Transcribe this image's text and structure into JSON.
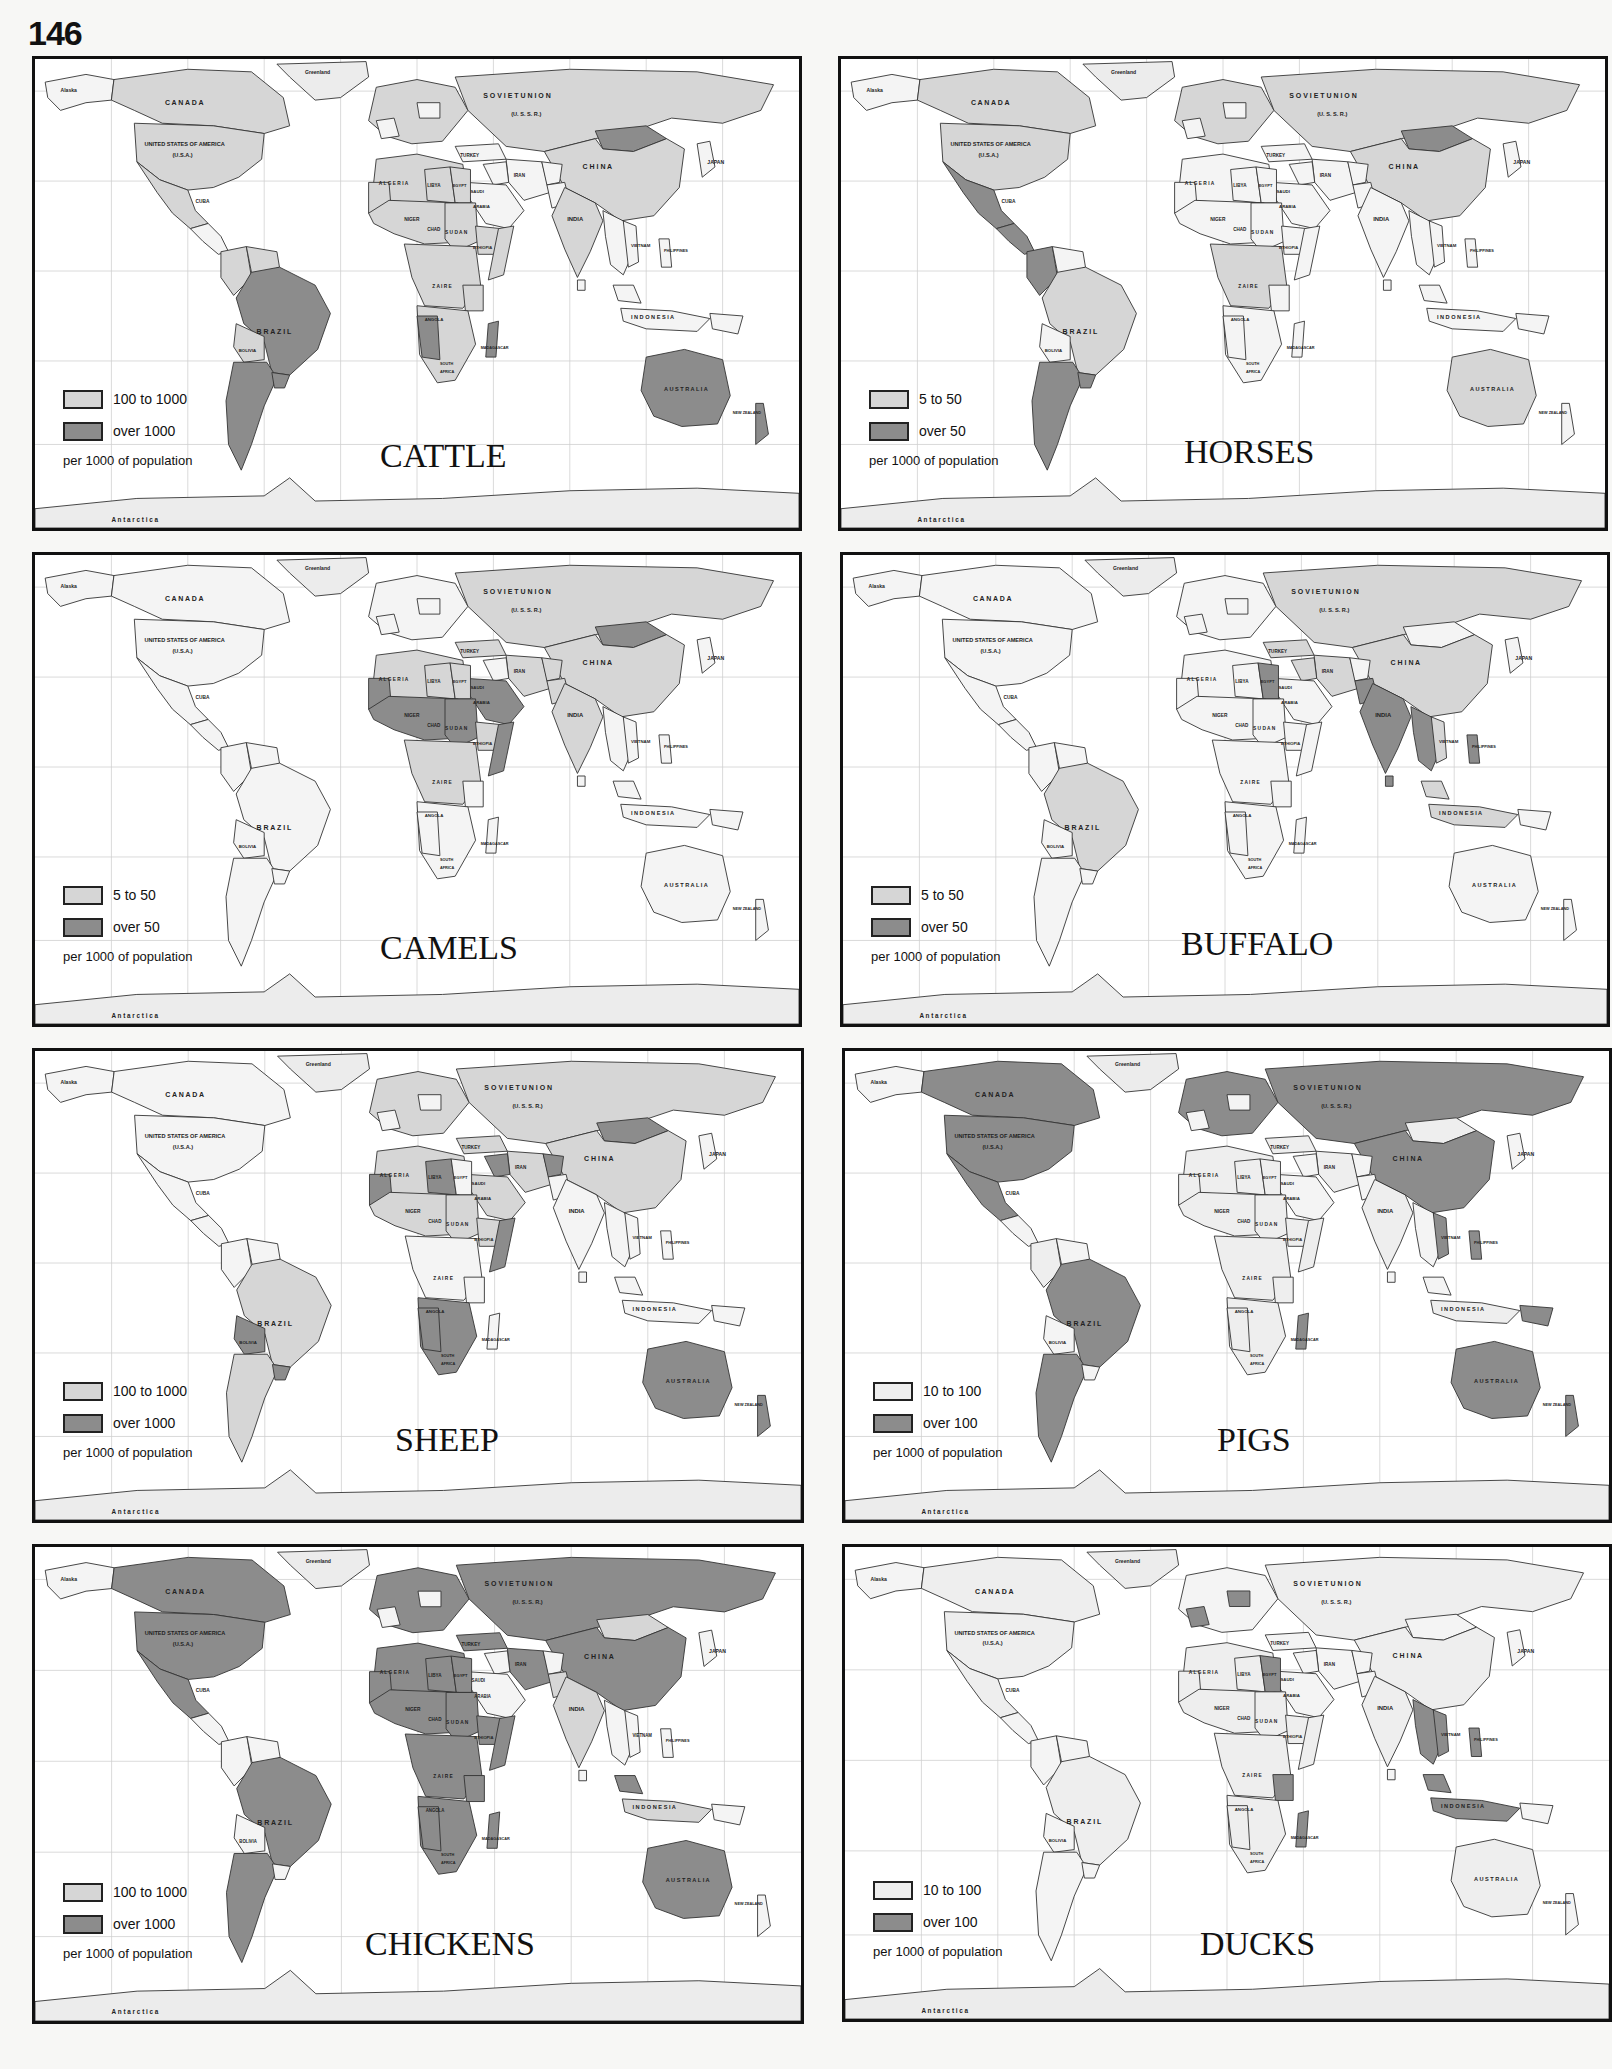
{
  "page_number": "146",
  "colors": {
    "light_shade": "#d6d6d6",
    "dark_shade": "#8c8c8c",
    "darker_shade": "#6f6f6f",
    "very_light_shade": "#eeeeee",
    "grid": "#c8c8c8",
    "border": "#111111"
  },
  "common": {
    "unit_note": "per 1000 of population",
    "map_labels": {
      "alaska": "Alaska",
      "greenland": "Greenland",
      "canada": "C A N A D A",
      "usa": "UNITED STATES OF AMERICA",
      "usa_abbr": "(U.S.A.)",
      "mexico": "MEXICO",
      "cuba": "CUBA",
      "venezuela": "VENEZUELA",
      "colombia": "COLOMBIA",
      "brazil": "B R A Z I L",
      "bolivia": "BOLIVIA",
      "uruguay": "URUGUAY",
      "soviet_union": "S O V I E T     U N I O N",
      "ussr": "(U. S. S. R.)",
      "mongolia": "PEOPLE'S REPUBLIC OF MONGOLIA",
      "china": "C H I N A",
      "japan": "JAPAN",
      "turkey": "TURKEY",
      "iran": "IRAN",
      "iraq": "IRAQ",
      "india": "INDIA",
      "pakistan": "PAKISTAN",
      "burma": "BURMA",
      "vietnam": "VIETNAM",
      "philippines": "PHILIPPINES",
      "malaysia": "MALAYSIA",
      "indonesia": "I N D O N E S I A",
      "papua": "PAPUA NEW GUINEA",
      "australia": "A U S T R A L I A",
      "new_zealand": "NEW ZEALAND",
      "algeria": "A L G E R I A",
      "libya": "LIBYA",
      "egypt": "EGYPT",
      "saudi": "SAUDI",
      "arabia": "ARABIA",
      "oman": "OMAN",
      "niger": "NIGER",
      "chad": "CHAD",
      "sudan": "S U D A N",
      "ethiopia": "ETHIOPIA",
      "nigeria": "NIGERIA",
      "zaire": "Z A I R E",
      "kenya": "KENYA",
      "angola": "ANGOLA",
      "zambia": "ZAMBIA",
      "madagascar": "MADAGASCAR",
      "south_africa_1": "SOUTH",
      "south_africa_2": "AFRICA",
      "sri_lanka": "SRI LANKA",
      "antarctica": "A    n    t    a    r    c    t    i    c    a"
    }
  },
  "maps": [
    {
      "id": "cattle",
      "title": "CATTLE",
      "legend": [
        {
          "label": "100 to 1000",
          "shade": "light"
        },
        {
          "label": "over 1000",
          "shade": "dark"
        }
      ],
      "dark_regions": [
        "Brazil",
        "Argentina",
        "Uruguay",
        "Australia",
        "Mongolia",
        "Namibia",
        "Botswana",
        "Madagascar",
        "New Zealand"
      ],
      "light_regions": [
        "Canada",
        "United States",
        "Mexico",
        "Soviet Union",
        "China",
        "India",
        "Africa (most)",
        "Europe",
        "Colombia",
        "Venezuela",
        "Bolivia"
      ]
    },
    {
      "id": "horses",
      "title": "HORSES",
      "legend": [
        {
          "label": "5 to 50",
          "shade": "light"
        },
        {
          "label": "over 50",
          "shade": "dark"
        }
      ],
      "dark_regions": [
        "Mexico",
        "Colombia",
        "Argentina",
        "Uruguay",
        "Mongolia",
        "Central America"
      ],
      "light_regions": [
        "Canada",
        "United States",
        "Brazil",
        "Soviet Union",
        "China",
        "Europe",
        "Australia",
        "Africa (parts)"
      ]
    },
    {
      "id": "camels",
      "title": "CAMELS",
      "legend": [
        {
          "label": "5 to 50",
          "shade": "light"
        },
        {
          "label": "over 50",
          "shade": "dark"
        }
      ],
      "dark_regions": [
        "Mauritania",
        "Mali",
        "Niger",
        "Chad",
        "Sudan",
        "Somalia",
        "Mongolia",
        "Western Sahara",
        "Oman"
      ],
      "light_regions": [
        "Soviet Union",
        "China",
        "India",
        "Pakistan",
        "Afghanistan",
        "Iran",
        "Saudi Arabia",
        "Algeria",
        "Libya",
        "Egypt",
        "Ethiopia",
        "Kenya",
        "Turkey"
      ]
    },
    {
      "id": "buffalo",
      "title": "BUFFALO",
      "legend": [
        {
          "label": "5 to 50",
          "shade": "light"
        },
        {
          "label": "over 50",
          "shade": "dark"
        }
      ],
      "dark_regions": [
        "India",
        "Pakistan",
        "Egypt",
        "Burma",
        "Thailand",
        "Laos",
        "Cambodia",
        "Nepal",
        "Philippines",
        "Sri Lanka"
      ],
      "light_regions": [
        "China",
        "Soviet Union",
        "Brazil",
        "Turkey",
        "Iran",
        "Iraq",
        "Vietnam",
        "Indonesia",
        "Malaysia"
      ]
    },
    {
      "id": "sheep",
      "title": "SHEEP",
      "legend": [
        {
          "label": "100 to 1000",
          "shade": "light"
        },
        {
          "label": "over 1000",
          "shade": "dark"
        }
      ],
      "dark_regions": [
        "Australia",
        "New Zealand",
        "Mongolia",
        "Libya",
        "Mauritania",
        "Afghanistan",
        "Syria",
        "Somalia",
        "Namibia",
        "South Africa",
        "Bolivia",
        "Uruguay",
        "Lesotho"
      ],
      "light_regions": [
        "Soviet Union",
        "China",
        "Turkey",
        "Iran",
        "Iraq",
        "Algeria",
        "Niger",
        "Sudan",
        "Ethiopia",
        "Brazil",
        "Argentina",
        "Europe",
        "Saudi Arabia"
      ]
    },
    {
      "id": "pigs",
      "title": "PIGS",
      "legend": [
        {
          "label": "10 to 100",
          "shade": "very_light"
        },
        {
          "label": "over 100",
          "shade": "dark"
        }
      ],
      "dark_regions": [
        "Canada",
        "United States",
        "Mexico",
        "Brazil",
        "Argentina",
        "Soviet Union",
        "China",
        "Europe",
        "Australia",
        "New Zealand",
        "Madagascar",
        "Vietnam",
        "Philippines",
        "Papua New Guinea"
      ],
      "light_regions": [
        "Africa (most)",
        "India",
        "Colombia",
        "Mongolia",
        "Indonesia",
        "Turkey",
        "Iran"
      ]
    },
    {
      "id": "chickens",
      "title": "CHICKENS",
      "legend": [
        {
          "label": "100 to 1000",
          "shade": "light"
        },
        {
          "label": "over 1000",
          "shade": "dark"
        }
      ],
      "dark_regions": [
        "Canada",
        "United States",
        "Mexico",
        "Brazil",
        "Argentina",
        "Soviet Union",
        "China",
        "Europe",
        "Africa (most)",
        "Madagascar",
        "Australia",
        "Malaysia",
        "Turkey",
        "Iran"
      ],
      "light_regions": [
        "India",
        "Indonesia",
        "Algeria",
        "Mongolia",
        "Pakistan",
        "Namibia",
        "Ethiopia"
      ]
    },
    {
      "id": "ducks",
      "title": "DUCKS",
      "legend": [
        {
          "label": "10 to 100",
          "shade": "very_light"
        },
        {
          "label": "over 100",
          "shade": "dark"
        }
      ],
      "dark_regions": [
        "France",
        "Poland",
        "Hungary",
        "Egypt",
        "Burma",
        "Thailand",
        "Laos",
        "Cambodia",
        "Vietnam",
        "Malaysia",
        "Indonesia",
        "Tanzania",
        "Madagascar",
        "Philippines"
      ],
      "light_regions": [
        "Canada",
        "United States",
        "Mexico",
        "Brazil",
        "Soviet Union",
        "China",
        "India",
        "Africa (most)",
        "Australia"
      ]
    }
  ]
}
